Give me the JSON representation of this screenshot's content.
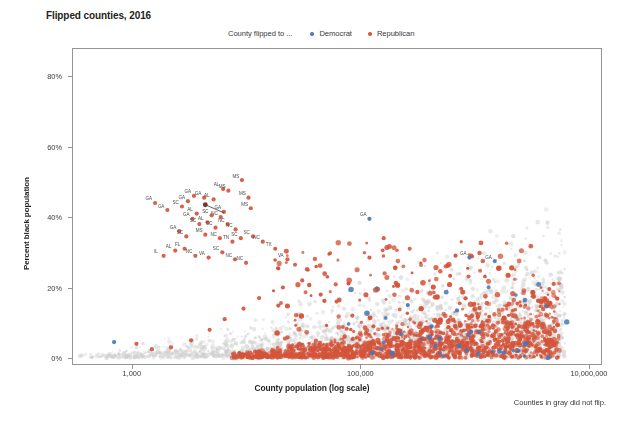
{
  "chart": {
    "title": "Flipped counties, 2016",
    "footnote": "Counties in gray did not flip.",
    "xlabel": "County population (log scale)",
    "ylabel": "Percent black population",
    "legend_caption": "County flipped to ...",
    "legend": [
      {
        "label": "Democrat",
        "color": "#4477bb",
        "key": "democrat"
      },
      {
        "label": "Republican",
        "color": "#d4543a",
        "key": "republican"
      }
    ],
    "colors": {
      "democrat": "#4477bb",
      "republican": "#d4543a",
      "no_flip": "#cfcfcf",
      "axis": "#949494",
      "text": "#231f20"
    }
  },
  "chart_data": {
    "type": "scatter",
    "title": "Flipped counties, 2016",
    "xlabel": "County population (log scale)",
    "ylabel": "Percent black population",
    "xscale": "log",
    "xlim": [
      300,
      13000000
    ],
    "ylim": [
      -2,
      88
    ],
    "grid": false,
    "legend_position": "top-center",
    "xticks": [
      {
        "value": 1000,
        "label": "1,000"
      },
      {
        "value": 100000,
        "label": "100,000"
      },
      {
        "value": 10000000,
        "label": "10,000,000"
      }
    ],
    "yticks": [
      {
        "value": 0,
        "label": "0%"
      },
      {
        "value": 20,
        "label": "20%"
      },
      {
        "value": 40,
        "label": "40%"
      },
      {
        "value": 60,
        "label": "60%"
      },
      {
        "value": 80,
        "label": "80%"
      }
    ],
    "annotation_note": "Counties in gray did not flip.",
    "series": [
      {
        "name": "Republican",
        "color": "#d4543a",
        "points": [
          {
            "x": 1600,
            "y": 44.0,
            "label": "GA"
          },
          {
            "x": 2050,
            "y": 42.0,
            "label": "GA"
          },
          {
            "x": 3100,
            "y": 44.5,
            "label": "GA"
          },
          {
            "x": 3500,
            "y": 46.0,
            "label": "GA"
          },
          {
            "x": 4300,
            "y": 45.5,
            "label": "GA"
          },
          {
            "x": 2750,
            "y": 43.0,
            "label": "SC"
          },
          {
            "x": 3700,
            "y": 41.0,
            "label": "AL"
          },
          {
            "x": 5200,
            "y": 45.0,
            "label": "AL"
          },
          {
            "x": 7000,
            "y": 47.5,
            "label": "MS"
          },
          {
            "x": 9200,
            "y": 50.5,
            "label": "MS"
          },
          {
            "x": 10500,
            "y": 45.5,
            "label": "MS"
          },
          {
            "x": 11000,
            "y": 42.5,
            "label": "MS"
          },
          {
            "x": 6300,
            "y": 48.0,
            "label": "AL"
          },
          {
            "x": 5000,
            "y": 40.5,
            "label": "SC"
          },
          {
            "x": 6000,
            "y": 40.0,
            "label": "NC"
          },
          {
            "x": 6400,
            "y": 41.5,
            "label": "GA"
          },
          {
            "x": 3400,
            "y": 39.5,
            "label": "GA"
          },
          {
            "x": 3900,
            "y": 38.0,
            "label": "SC"
          },
          {
            "x": 4600,
            "y": 38.5,
            "label": "AL"
          },
          {
            "x": 5400,
            "y": 37.0,
            "label": "SC"
          },
          {
            "x": 6900,
            "y": 38.0,
            "label": "NC"
          },
          {
            "x": 8100,
            "y": 36.5,
            "label": "NC"
          },
          {
            "x": 2600,
            "y": 36.0,
            "label": "GA"
          },
          {
            "x": 3000,
            "y": 34.5,
            "label": "SC"
          },
          {
            "x": 4400,
            "y": 35.0,
            "label": "MS"
          },
          {
            "x": 5900,
            "y": 34.0,
            "label": "NC"
          },
          {
            "x": 7600,
            "y": 33.0,
            "label": "TN"
          },
          {
            "x": 9000,
            "y": 34.0,
            "label": "SC"
          },
          {
            "x": 11500,
            "y": 34.5,
            "label": "SC"
          },
          {
            "x": 14000,
            "y": 33.0,
            "label": "NC"
          },
          {
            "x": 2400,
            "y": 30.5,
            "label": "AL"
          },
          {
            "x": 2900,
            "y": 31.0,
            "label": "FL"
          },
          {
            "x": 3600,
            "y": 29.0,
            "label": "NC"
          },
          {
            "x": 4700,
            "y": 28.5,
            "label": "VA"
          },
          {
            "x": 6200,
            "y": 30.0,
            "label": "SC"
          },
          {
            "x": 8000,
            "y": 28.0,
            "label": "NC"
          },
          {
            "x": 10000,
            "y": 27.0,
            "label": "NC"
          },
          {
            "x": 1900,
            "y": 29.0,
            "label": "IL"
          },
          {
            "x": 18000,
            "y": 31.0,
            "label": "TX"
          },
          {
            "x": 23000,
            "y": 28.0,
            "label": "VA"
          },
          {
            "x": 160000,
            "y": 34.0,
            "label": ""
          },
          {
            "x": 120000,
            "y": 28.5,
            "label": ""
          },
          {
            "x": 1100,
            "y": 4.0,
            "label": ""
          },
          {
            "x": 1500,
            "y": 2.5,
            "label": ""
          },
          {
            "x": 2200,
            "y": 3.0,
            "label": ""
          },
          {
            "x": 3300,
            "y": 5.0,
            "label": ""
          },
          {
            "x": 4800,
            "y": 8.0,
            "label": ""
          },
          {
            "x": 6500,
            "y": 11.0,
            "label": ""
          },
          {
            "x": 9500,
            "y": 14.0,
            "label": ""
          },
          {
            "x": 13000,
            "y": 17.0,
            "label": ""
          },
          {
            "x": 21000,
            "y": 20.0,
            "label": ""
          },
          {
            "x": 31000,
            "y": 22.0,
            "label": ""
          },
          {
            "x": 45000,
            "y": 18.0,
            "label": ""
          },
          {
            "x": 62000,
            "y": 16.0,
            "label": ""
          },
          {
            "x": 85000,
            "y": 12.0,
            "label": ""
          },
          {
            "x": 130000,
            "y": 9.0,
            "label": ""
          },
          {
            "x": 210000,
            "y": 7.0,
            "label": ""
          },
          {
            "x": 330000,
            "y": 5.0,
            "label": ""
          },
          {
            "x": 520000,
            "y": 4.0,
            "label": ""
          },
          {
            "x": 800000,
            "y": 3.0,
            "label": ""
          }
        ]
      },
      {
        "name": "Democrat",
        "color": "#4477bb",
        "points": [
          {
            "x": 700,
            "y": 4.5,
            "label": ""
          },
          {
            "x": 120000,
            "y": 39.5,
            "label": "GA"
          },
          {
            "x": 900000,
            "y": 28.5,
            "label": "GA"
          },
          {
            "x": 1500000,
            "y": 27.5,
            "label": "GA"
          },
          {
            "x": 260000,
            "y": 15.0,
            "label": ""
          },
          {
            "x": 700000,
            "y": 13.5,
            "label": ""
          },
          {
            "x": 420000,
            "y": 9.0,
            "label": ""
          },
          {
            "x": 1100000,
            "y": 7.5,
            "label": ""
          },
          {
            "x": 2400000,
            "y": 2.0,
            "label": ""
          },
          {
            "x": 1800000,
            "y": 1.5,
            "label": ""
          }
        ]
      },
      {
        "name": "Did not flip",
        "color": "#cfcfcf",
        "points": []
      }
    ]
  },
  "clipped_bottom_text": ""
}
